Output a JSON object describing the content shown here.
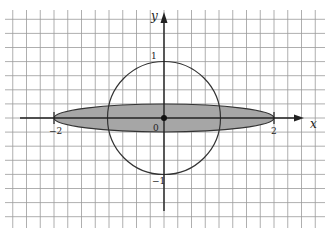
{
  "figure": {
    "axes": {
      "x_label": "x",
      "y_label": "y",
      "origin_label": "0",
      "tick_labels": {
        "x_neg2": "−2",
        "x_pos2": "2",
        "y_pos1": "1",
        "y_neg1": "−1"
      }
    },
    "shapes": {
      "circle": {
        "center": [
          0,
          0
        ],
        "radius": 1,
        "stroke": "#333333",
        "fill": "none"
      },
      "ellipse": {
        "center": [
          0,
          0
        ],
        "semi_axis_x": 2,
        "semi_axis_y": 0.25,
        "fill": "#a6a6a6",
        "stroke": "#333333"
      },
      "origin_point": {
        "at": [
          0,
          0
        ],
        "color": "#111111"
      }
    },
    "colors": {
      "grid": "#9a9a9a",
      "axes": "#222222",
      "shade": "#a6a6a6",
      "background": "#ffffff"
    }
  }
}
